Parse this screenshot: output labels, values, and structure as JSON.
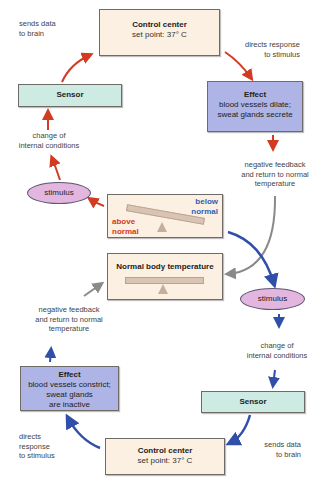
{
  "colors": {
    "warm_arrow": "#d23a22",
    "cool_arrow": "#2f4fa8",
    "feedback_arrow": "#8a8a8a",
    "control_center_fill": "#fbf0e2",
    "sensor_fill": "#cdeae3",
    "effect_fill": "#aeb4e6",
    "stimulus_fill": "#e3b6e0",
    "above_normal_text": "#d23a22",
    "below_normal_text": "#2f5fb8"
  },
  "top_loop": {
    "control_center": {
      "title": "Control center",
      "detail": "set point: 37° C"
    },
    "sensor": {
      "label": "Sensor"
    },
    "effect": {
      "title": "Effect",
      "line1": "blood vessels dilate;",
      "line2": "sweat glands secrete"
    },
    "sends_data": {
      "line1": "sends data",
      "line2": "to brain"
    },
    "directs_response": {
      "line1": "directs response",
      "line2": "to stimulus"
    },
    "change_conditions": {
      "line1": "change of",
      "line2": "internal conditions"
    },
    "stimulus": {
      "label": "stimulus"
    },
    "negative_feedback": {
      "line1": "negative feedback",
      "line2": "and return to normal",
      "line3": "temperature"
    }
  },
  "center": {
    "imbalance_box": {
      "above_line1": "above",
      "above_line2": "normal",
      "below_line1": "below",
      "below_line2": "normal"
    },
    "normal_box": {
      "title": "Normal body temperature"
    }
  },
  "bottom_loop": {
    "stimulus": {
      "label": "stimulus"
    },
    "change_conditions": {
      "line1": "change of",
      "line2": "internal conditions"
    },
    "sensor": {
      "label": "Sensor"
    },
    "sends_data": {
      "line1": "sends data",
      "line2": "to brain"
    },
    "control_center": {
      "title": "Control center",
      "detail": "set point: 37° C"
    },
    "directs_response": {
      "line1": "directs",
      "line2": "response",
      "line3": "to stimulus"
    },
    "effect": {
      "title": "Effect",
      "line1": "blood vessels constrict;",
      "line2": "sweat glands",
      "line3": "are inactive"
    },
    "negative_feedback": {
      "line1": "negative feedback",
      "line2": "and return to normal",
      "line3": "temperature"
    }
  }
}
